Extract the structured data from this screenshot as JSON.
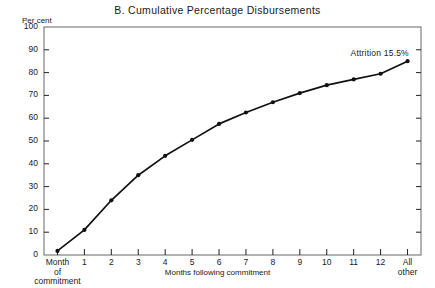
{
  "chart_data": {
    "type": "line",
    "title": "B.  Cumulative Percentage Disbursements",
    "xlabel": "Months following commitment",
    "ylabel": "Per cent",
    "ylim": [
      0,
      100
    ],
    "ytick_values": [
      0,
      10,
      20,
      30,
      40,
      50,
      60,
      70,
      80,
      90,
      100
    ],
    "ytick_labels": [
      "0",
      "10",
      "20",
      "30",
      "40",
      "50",
      "60",
      "70",
      "80",
      "90",
      "100"
    ],
    "categories": [
      "Month of commitment",
      "1",
      "2",
      "3",
      "4",
      "5",
      "6",
      "7",
      "8",
      "9",
      "10",
      "11",
      "12",
      "All other"
    ],
    "xtick_labels": [
      [
        "Month",
        "of",
        "commitment"
      ],
      [
        "1"
      ],
      [
        "2"
      ],
      [
        "3"
      ],
      [
        "4"
      ],
      [
        "5"
      ],
      [
        "6"
      ],
      [
        "7"
      ],
      [
        "8"
      ],
      [
        "9"
      ],
      [
        "10"
      ],
      [
        "11"
      ],
      [
        "12"
      ],
      [
        "All",
        "other"
      ]
    ],
    "values": [
      1.8,
      11.0,
      24.0,
      35.0,
      43.5,
      50.5,
      57.5,
      62.5,
      67.0,
      71.0,
      74.5,
      77.0,
      79.5,
      85.0
    ],
    "grid": false,
    "legend": false,
    "marker": "filled-circle",
    "line_color": "#111111",
    "annotations": [
      {
        "text": "Attrition 15.5%",
        "x_category": "12",
        "y_value": 88
      }
    ]
  },
  "axes": {
    "frame_color": "#555555",
    "tick_color": "#222222"
  }
}
